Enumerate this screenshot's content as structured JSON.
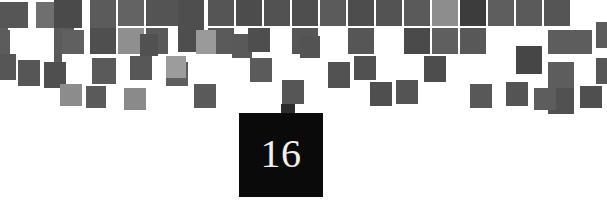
{
  "page": {
    "width": 607,
    "height": 221,
    "background_color": "#ffffff",
    "kind": "chapter-divider"
  },
  "chapter": {
    "number": "16",
    "badge_color": "#0b0a0a",
    "number_color": "#f2f0ee",
    "badge": {
      "x": 239,
      "y": 113,
      "width": 84,
      "height": 84
    },
    "tab": {
      "x": 281,
      "y": 104,
      "width": 14,
      "height": 10,
      "color": "#2e2d2d"
    }
  },
  "mosaic": {
    "grid": {
      "cell": 18,
      "tile": 16,
      "origin_x": 0,
      "origin_y": 0
    },
    "palette": {
      "dark": "#4a4a4a",
      "mid": "#5e5e5e",
      "mid2": "#666666",
      "light": "#8d8d8d",
      "lighter": "#a3a3a3",
      "darkest": "#3a3a3a"
    },
    "tiles": [
      {
        "x": 0,
        "y": 2,
        "w": 28,
        "h": 26,
        "c": "#565656"
      },
      {
        "x": 36,
        "y": 2,
        "w": 18,
        "h": 26,
        "c": "#6f6f6f"
      },
      {
        "x": 54,
        "y": 0,
        "w": 28,
        "h": 28,
        "c": "#4a4a4a"
      },
      {
        "x": 54,
        "y": 28,
        "w": 20,
        "h": 26,
        "c": "#5b5b5b"
      },
      {
        "x": 0,
        "y": 28,
        "w": 8,
        "h": 26,
        "c": "#5e5e5e"
      },
      {
        "x": 90,
        "y": 0,
        "w": 26,
        "h": 28,
        "c": "#5b5b5b"
      },
      {
        "x": 90,
        "y": 28,
        "w": 26,
        "h": 26,
        "c": "#4f4f4f"
      },
      {
        "x": 118,
        "y": 28,
        "w": 26,
        "h": 26,
        "c": "#8f8f8f"
      },
      {
        "x": 118,
        "y": 0,
        "w": 26,
        "h": 26,
        "c": "#636363"
      },
      {
        "x": 146,
        "y": 0,
        "w": 44,
        "h": 26,
        "c": "#545454"
      },
      {
        "x": 146,
        "y": 28,
        "w": 22,
        "h": 26,
        "c": "#5a5a5a"
      },
      {
        "x": 178,
        "y": 0,
        "w": 26,
        "h": 52,
        "c": "#4e4e4e"
      },
      {
        "x": 54,
        "y": 54,
        "w": 8,
        "h": 24,
        "c": "#595959"
      },
      {
        "x": 0,
        "y": 54,
        "w": 16,
        "h": 26,
        "c": "#565656"
      },
      {
        "x": 18,
        "y": 60,
        "w": 22,
        "h": 26,
        "c": "#565656"
      },
      {
        "x": 44,
        "y": 62,
        "w": 22,
        "h": 26,
        "c": "#4f4f4f"
      },
      {
        "x": 60,
        "y": 84,
        "w": 22,
        "h": 22,
        "c": "#8c8c8c"
      },
      {
        "x": 92,
        "y": 58,
        "w": 24,
        "h": 26,
        "c": "#5a5a5a"
      },
      {
        "x": 130,
        "y": 56,
        "w": 22,
        "h": 24,
        "c": "#575757"
      },
      {
        "x": 0,
        "y": 30,
        "w": 10,
        "h": 24,
        "c": "#5c5c5c"
      },
      {
        "x": 208,
        "y": 0,
        "w": 26,
        "h": 26,
        "c": "#555555"
      },
      {
        "x": 236,
        "y": 0,
        "w": 26,
        "h": 26,
        "c": "#4c4c4c"
      },
      {
        "x": 208,
        "y": 28,
        "w": 26,
        "h": 26,
        "c": "#5a5a5a"
      },
      {
        "x": 264,
        "y": 0,
        "w": 26,
        "h": 26,
        "c": "#525252"
      },
      {
        "x": 292,
        "y": 0,
        "w": 26,
        "h": 26,
        "c": "#4e4e4e"
      },
      {
        "x": 292,
        "y": 28,
        "w": 26,
        "h": 26,
        "c": "#565656"
      },
      {
        "x": 320,
        "y": 0,
        "w": 26,
        "h": 26,
        "c": "#5b5b5b"
      },
      {
        "x": 348,
        "y": 0,
        "w": 26,
        "h": 26,
        "c": "#4d4d4d"
      },
      {
        "x": 348,
        "y": 28,
        "w": 26,
        "h": 26,
        "c": "#565656"
      },
      {
        "x": 376,
        "y": 0,
        "w": 26,
        "h": 26,
        "c": "#535353"
      },
      {
        "x": 404,
        "y": 0,
        "w": 26,
        "h": 26,
        "c": "#5a5a5a"
      },
      {
        "x": 404,
        "y": 28,
        "w": 26,
        "h": 26,
        "c": "#4a4a4a"
      },
      {
        "x": 432,
        "y": 0,
        "w": 26,
        "h": 26,
        "c": "#8d8d8d"
      },
      {
        "x": 432,
        "y": 28,
        "w": 26,
        "h": 26,
        "c": "#5f5f5f"
      },
      {
        "x": 460,
        "y": 0,
        "w": 26,
        "h": 26,
        "c": "#3c3c3c"
      },
      {
        "x": 460,
        "y": 28,
        "w": 26,
        "h": 26,
        "c": "#585858"
      },
      {
        "x": 488,
        "y": 0,
        "w": 26,
        "h": 26,
        "c": "#5e5e5e"
      },
      {
        "x": 516,
        "y": 0,
        "w": 26,
        "h": 26,
        "c": "#5a5a5a"
      },
      {
        "x": 544,
        "y": 0,
        "w": 26,
        "h": 26,
        "c": "#555555"
      },
      {
        "x": 548,
        "y": 30,
        "w": 44,
        "h": 24,
        "c": "#5d5d5d"
      },
      {
        "x": 516,
        "y": 46,
        "w": 26,
        "h": 28,
        "c": "#464646"
      },
      {
        "x": 548,
        "y": 62,
        "w": 26,
        "h": 26,
        "c": "#5d5d5d"
      },
      {
        "x": 548,
        "y": 88,
        "w": 26,
        "h": 26,
        "c": "#515151"
      },
      {
        "x": 596,
        "y": 22,
        "w": 11,
        "h": 26,
        "c": "#5c5c5c"
      },
      {
        "x": 596,
        "y": 58,
        "w": 11,
        "h": 26,
        "c": "#565656"
      },
      {
        "x": 232,
        "y": 34,
        "w": 20,
        "h": 24,
        "c": "#595959"
      },
      {
        "x": 250,
        "y": 58,
        "w": 22,
        "h": 24,
        "c": "#5b5b5b"
      },
      {
        "x": 166,
        "y": 62,
        "w": 22,
        "h": 24,
        "c": "#5e5e5e"
      },
      {
        "x": 194,
        "y": 84,
        "w": 22,
        "h": 24,
        "c": "#5a5a5a"
      },
      {
        "x": 282,
        "y": 80,
        "w": 22,
        "h": 24,
        "c": "#565656"
      },
      {
        "x": 328,
        "y": 62,
        "w": 22,
        "h": 26,
        "c": "#525252"
      },
      {
        "x": 370,
        "y": 82,
        "w": 22,
        "h": 24,
        "c": "#4f4f4f"
      },
      {
        "x": 396,
        "y": 80,
        "w": 22,
        "h": 24,
        "c": "#545454"
      },
      {
        "x": 354,
        "y": 56,
        "w": 22,
        "h": 24,
        "c": "#515151"
      },
      {
        "x": 424,
        "y": 56,
        "w": 22,
        "h": 26,
        "c": "#4d4d4d"
      },
      {
        "x": 470,
        "y": 84,
        "w": 22,
        "h": 24,
        "c": "#585858"
      },
      {
        "x": 506,
        "y": 82,
        "w": 22,
        "h": 24,
        "c": "#545454"
      },
      {
        "x": 534,
        "y": 88,
        "w": 22,
        "h": 22,
        "c": "#5d5d5d"
      },
      {
        "x": 580,
        "y": 86,
        "w": 22,
        "h": 22,
        "c": "#4f4f4f"
      },
      {
        "x": 124,
        "y": 88,
        "w": 22,
        "h": 22,
        "c": "#8a8a8a"
      },
      {
        "x": 86,
        "y": 86,
        "w": 20,
        "h": 22,
        "c": "#5a5a5a"
      },
      {
        "x": 300,
        "y": 36,
        "w": 20,
        "h": 22,
        "c": "#535353"
      },
      {
        "x": 140,
        "y": 34,
        "w": 18,
        "h": 22,
        "c": "#515151"
      },
      {
        "x": 196,
        "y": 30,
        "w": 20,
        "h": 24,
        "c": "#9a9a9a"
      },
      {
        "x": 62,
        "y": 30,
        "w": 22,
        "h": 24,
        "c": "#606060"
      },
      {
        "x": 166,
        "y": 56,
        "w": 20,
        "h": 22,
        "c": "#9c9c9c"
      },
      {
        "x": 248,
        "y": 28,
        "w": 22,
        "h": 24,
        "c": "#4e4e4e"
      }
    ]
  }
}
